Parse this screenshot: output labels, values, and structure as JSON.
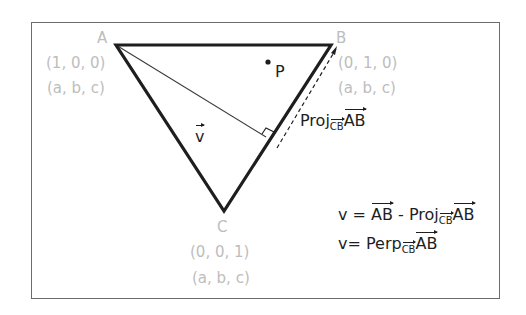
{
  "diagram": {
    "vertices": {
      "A": {
        "label": "A",
        "coord1": "(1, 0, 0)",
        "coord2": "(a, b, c)"
      },
      "B": {
        "label": "B",
        "coord1": "(0, 1, 0)",
        "coord2": "(a, b, c)"
      },
      "C": {
        "label": "C",
        "coord1": "(0, 0, 1)",
        "coord2": "(a, b, c)"
      }
    },
    "point_label": "P",
    "vector_label": "v",
    "projection_label": {
      "main": "Proj",
      "subscript": "CB",
      "vector": "AB"
    },
    "equations": [
      {
        "lhs": "v = ",
        "term1": "AB",
        "op": " - ",
        "func": "Proj",
        "subscript": "CB",
        "term2": "AB"
      },
      {
        "lhs": "v= ",
        "func": "Perp",
        "subscript": "CB",
        "term2": "AB"
      }
    ],
    "colors": {
      "triangle": "#1e1e1e",
      "labels_gray": "#bdbdbd",
      "frame": "#6b6b6b"
    }
  }
}
